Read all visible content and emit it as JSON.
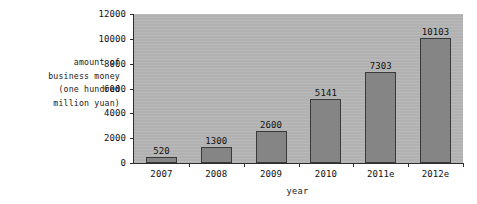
{
  "chart_data": {
    "type": "bar",
    "title": "",
    "subtitle": "",
    "xlabel": "year",
    "ylabel": "amount of business money (one hundred million yuan)",
    "ylabel_lines": [
      "amount of",
      "business money",
      "(one hundred",
      "million yuan)"
    ],
    "categories": [
      "2007",
      "2008",
      "2009",
      "2010",
      "2011e",
      "2012e"
    ],
    "values": [
      520,
      1300,
      2600,
      5141,
      7303,
      10103
    ],
    "value_labels": [
      "520",
      "1300",
      "2600",
      "5141",
      "7303",
      "10103"
    ],
    "ylim": [
      0,
      12000
    ],
    "ytick_labels": [
      "0",
      "2000",
      "4000",
      "6000",
      "8000",
      "10000",
      "12000"
    ],
    "ytick_values": [
      0,
      2000,
      4000,
      6000,
      8000,
      10000,
      12000
    ],
    "grid": false,
    "legend": false,
    "legend_position": "none",
    "colors": {
      "bar_fill": "#858585",
      "bar_border": "#3a3a3a",
      "plot_background": "#b5b5b5",
      "page_background": "#ffffff",
      "axis_line": "#2e2e2e",
      "text": "#111111"
    }
  }
}
